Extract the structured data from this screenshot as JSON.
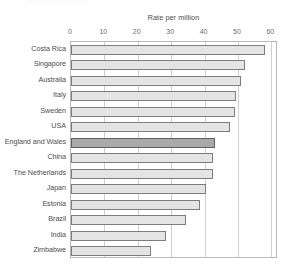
{
  "figure": {
    "background_color": "#ffffff",
    "frame_color": "#b9b9b9",
    "grid_color": "#cfcfcf",
    "bar_fill_color": "#e4e4e4",
    "bar_edge_color": "#7d7d7d",
    "highlight_fill_color": "#a9a9a9",
    "highlight_edge_color": "#5e5e5e",
    "label_color": "#4e4e4e",
    "tick_color": "#6d6d6d"
  },
  "chart_data": {
    "type": "bar",
    "orientation": "horizontal",
    "title": "Rate per million",
    "subtitle": "",
    "xlabel": "Rate per million",
    "ylabel": "",
    "xlim": [
      0,
      62
    ],
    "xticks": [
      0,
      10,
      20,
      30,
      40,
      50,
      60
    ],
    "xtick_labels": [
      "0",
      "10",
      "20",
      "30",
      "40",
      "50",
      "60"
    ],
    "grid": true,
    "grid_axis": "x",
    "legend": false,
    "legend_position": "none",
    "highlight_category": "England and Wales",
    "categories": [
      "Costa Rica",
      "Singapore",
      "Australia",
      "Italy",
      "Sweden",
      "USA",
      "England and Wales",
      "China",
      "The Netherlands",
      "Japan",
      "Estonia",
      "Brazil",
      "India",
      "Zimbabwe"
    ],
    "values": [
      58,
      52,
      51,
      49.5,
      49,
      47.5,
      43,
      42.5,
      42.5,
      40.5,
      38.5,
      34.5,
      28.5,
      24
    ],
    "series": [
      {
        "name": "Rate per million",
        "values": [
          58,
          52,
          51,
          49.5,
          49,
          47.5,
          43,
          42.5,
          42.5,
          40.5,
          38.5,
          34.5,
          28.5,
          24
        ]
      }
    ]
  }
}
